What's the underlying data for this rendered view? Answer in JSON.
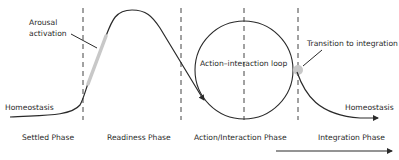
{
  "diagram": {
    "annotations": {
      "arousal_line1": "Arousal",
      "arousal_line2": "activation",
      "homeostasis_left": "Homeostasis",
      "loop": "Action–interaction loop",
      "transition": "Transition to integration",
      "homeostasis_right": "Homeostasis"
    },
    "phases": [
      {
        "label": "Settled Phase"
      },
      {
        "label": "Readiness Phase"
      },
      {
        "label": "Action/Interaction Phase"
      },
      {
        "label": "Integration Phase"
      }
    ],
    "colors": {
      "line": "#2a2a2a",
      "highlight": "#c8c8c8",
      "dashes": "#444444"
    }
  }
}
